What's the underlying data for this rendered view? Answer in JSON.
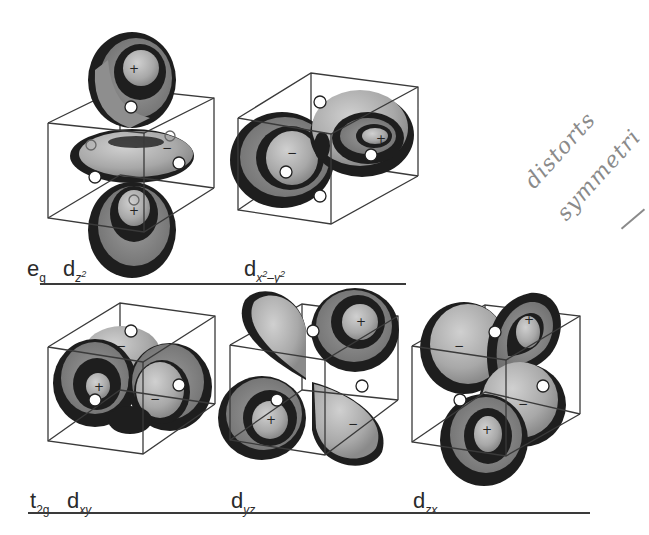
{
  "figure": {
    "rows": [
      {
        "set_label": {
          "main": "e",
          "sub": "g"
        },
        "orbitals": [
          {
            "id": "dz2",
            "label_main": "d",
            "label_sub": "z",
            "label_sup": "2",
            "lobe_signs": [
              "+",
              "−",
              "+"
            ]
          },
          {
            "id": "dx2-y2",
            "label_main": "d",
            "label_sub": "x",
            "label_sup1": "2",
            "label_mid": "–y",
            "label_sup2": "2",
            "lobe_signs": [
              "−",
              "+"
            ]
          }
        ]
      },
      {
        "set_label": {
          "main": "t",
          "sub": "2g"
        },
        "orbitals": [
          {
            "id": "dxy",
            "label_main": "d",
            "label_sub": "xy",
            "lobe_signs": [
              "+",
              "−",
              "−"
            ]
          },
          {
            "id": "dyz",
            "label_main": "d",
            "label_sub": "yz",
            "lobe_signs": [
              "+",
              "+",
              "−"
            ]
          },
          {
            "id": "dzx",
            "label_main": "d",
            "label_sub": "zx",
            "lobe_signs": [
              "+",
              "−",
              "−",
              "+"
            ]
          }
        ]
      }
    ],
    "handwritten_note": {
      "line1": "distorts",
      "line2": "symmetri"
    },
    "colors": {
      "lobe_light": "#b4b4b4",
      "lobe_mid": "#8e8e8e",
      "lobe_dark": "#1e1e1e",
      "cube_edge": "#3a3a3a",
      "ink_note": "#8a8a8a"
    }
  }
}
